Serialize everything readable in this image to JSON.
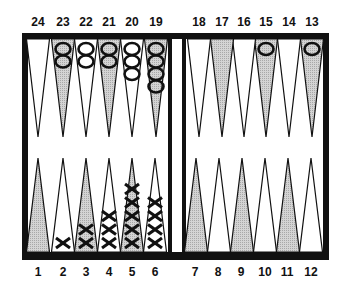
{
  "board": {
    "title": "Backgammon board",
    "colors": {
      "frame": "#111111",
      "shaded_point": "#c8c8c8",
      "light_point": "#ffffff",
      "background": "#ffffff"
    },
    "top_numbers": [
      "24",
      "23",
      "22",
      "21",
      "20",
      "19",
      "18",
      "17",
      "16",
      "15",
      "14",
      "13"
    ],
    "bottom_numbers": [
      "1",
      "2",
      "3",
      "4",
      "5",
      "6",
      "7",
      "8",
      "9",
      "10",
      "11",
      "12"
    ],
    "points": [
      {
        "n": 1,
        "shaded": true,
        "checker": "",
        "count": 0
      },
      {
        "n": 2,
        "shaded": false,
        "checker": "X",
        "count": 1
      },
      {
        "n": 3,
        "shaded": true,
        "checker": "X",
        "count": 2
      },
      {
        "n": 4,
        "shaded": false,
        "checker": "X",
        "count": 3
      },
      {
        "n": 5,
        "shaded": true,
        "checker": "X",
        "count": 5
      },
      {
        "n": 6,
        "shaded": false,
        "checker": "X",
        "count": 4
      },
      {
        "n": 7,
        "shaded": true,
        "checker": "",
        "count": 0
      },
      {
        "n": 8,
        "shaded": false,
        "checker": "",
        "count": 0
      },
      {
        "n": 9,
        "shaded": true,
        "checker": "",
        "count": 0
      },
      {
        "n": 10,
        "shaded": false,
        "checker": "",
        "count": 0
      },
      {
        "n": 11,
        "shaded": true,
        "checker": "",
        "count": 0
      },
      {
        "n": 12,
        "shaded": false,
        "checker": "",
        "count": 0
      },
      {
        "n": 13,
        "shaded": true,
        "checker": "O",
        "count": 1
      },
      {
        "n": 14,
        "shaded": false,
        "checker": "",
        "count": 0
      },
      {
        "n": 15,
        "shaded": true,
        "checker": "O",
        "count": 1
      },
      {
        "n": 16,
        "shaded": false,
        "checker": "",
        "count": 0
      },
      {
        "n": 17,
        "shaded": true,
        "checker": "",
        "count": 0
      },
      {
        "n": 18,
        "shaded": false,
        "checker": "",
        "count": 0
      },
      {
        "n": 19,
        "shaded": true,
        "checker": "O",
        "count": 4
      },
      {
        "n": 20,
        "shaded": false,
        "checker": "O",
        "count": 3
      },
      {
        "n": 21,
        "shaded": true,
        "checker": "O",
        "count": 2
      },
      {
        "n": 22,
        "shaded": false,
        "checker": "O",
        "count": 2
      },
      {
        "n": 23,
        "shaded": true,
        "checker": "O",
        "count": 2
      },
      {
        "n": 24,
        "shaded": false,
        "checker": "",
        "count": 0
      }
    ]
  }
}
